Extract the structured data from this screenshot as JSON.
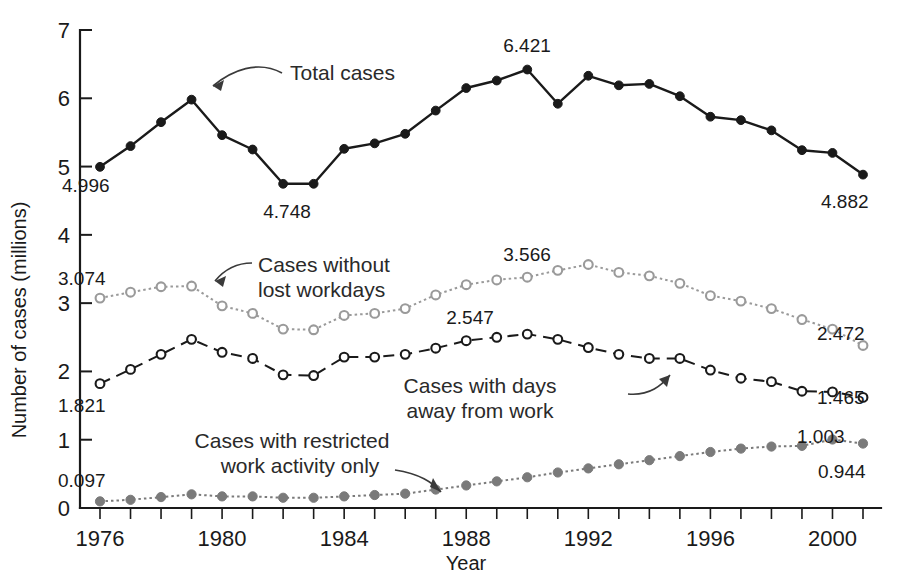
{
  "chart_data": {
    "type": "line",
    "title": "",
    "xlabel": "Year",
    "ylabel": "Number of cases (millions)",
    "xlim": [
      1976,
      2001
    ],
    "ylim": [
      0,
      7
    ],
    "grid": false,
    "legend_position": "inline-annotations",
    "x": [
      1976,
      1977,
      1978,
      1979,
      1980,
      1981,
      1982,
      1983,
      1984,
      1985,
      1986,
      1987,
      1988,
      1989,
      1990,
      1991,
      1992,
      1993,
      1994,
      1995,
      1996,
      1997,
      1998,
      1999,
      2000,
      2001
    ],
    "xtick_labels": [
      "1976",
      "1980",
      "1984",
      "1988",
      "1992",
      "1996",
      "2000"
    ],
    "xtick_values": [
      1976,
      1980,
      1984,
      1988,
      1992,
      1996,
      2000
    ],
    "ytick_labels": [
      "0",
      "1",
      "2",
      "3",
      "4",
      "5",
      "6",
      "7"
    ],
    "ytick_values": [
      0,
      1,
      2,
      3,
      4,
      5,
      6,
      7
    ],
    "series": [
      {
        "name": "Total cases",
        "marker": "filled-circle",
        "linestyle": "solid",
        "color": "#1a1a1a",
        "values": [
          4.996,
          5.3,
          5.65,
          5.98,
          5.46,
          5.25,
          4.748,
          4.748,
          5.26,
          5.34,
          5.48,
          5.82,
          6.15,
          6.26,
          6.421,
          5.92,
          6.33,
          6.19,
          6.21,
          6.03,
          5.73,
          5.68,
          5.53,
          5.24,
          5.2,
          4.882
        ],
        "endpoint_labels": [
          {
            "x": 1976,
            "value": 4.996,
            "text": "4.996"
          },
          {
            "x": 1982,
            "value": 4.748,
            "text": "4.748"
          },
          {
            "x": 1990,
            "value": 6.421,
            "text": "6.421"
          },
          {
            "x": 2001,
            "value": 4.882,
            "text": "4.882"
          }
        ]
      },
      {
        "name": "Cases without lost workdays",
        "marker": "open-circle",
        "linestyle": "dotted",
        "color": "#9a9a9a",
        "values": [
          3.074,
          3.16,
          3.24,
          3.25,
          2.96,
          2.85,
          2.62,
          2.61,
          2.82,
          2.85,
          2.92,
          3.12,
          3.27,
          3.34,
          3.38,
          3.48,
          3.566,
          3.45,
          3.4,
          3.29,
          3.11,
          3.03,
          2.92,
          2.76,
          2.62,
          2.38
        ],
        "endpoint_labels": [
          {
            "x": 1976,
            "value": 3.074,
            "text": "3.074"
          },
          {
            "x": 1992,
            "value": 3.566,
            "text": "3.566"
          },
          {
            "x": 2000,
            "value": 2.472,
            "text": "2.472"
          }
        ]
      },
      {
        "name": "Cases with days away from work",
        "marker": "open-circle",
        "linestyle": "dashed",
        "color": "#1a1a1a",
        "values": [
          1.821,
          2.03,
          2.25,
          2.47,
          2.28,
          2.19,
          1.95,
          1.94,
          2.21,
          2.21,
          2.25,
          2.34,
          2.45,
          2.5,
          2.547,
          2.47,
          2.35,
          2.25,
          2.19,
          2.19,
          2.02,
          1.9,
          1.85,
          1.71,
          1.7,
          1.62
        ],
        "endpoint_labels": [
          {
            "x": 1976,
            "value": 1.821,
            "text": "1.821"
          },
          {
            "x": 1990,
            "value": 2.547,
            "text": "2.547"
          },
          {
            "x": 2000,
            "value": 1.465,
            "text": "1.465"
          }
        ]
      },
      {
        "name": "Cases with restricted work activity only",
        "marker": "filled-circle-gray",
        "linestyle": "dotted",
        "color": "#7a7a7a",
        "values": [
          0.097,
          0.12,
          0.16,
          0.2,
          0.17,
          0.17,
          0.15,
          0.15,
          0.17,
          0.19,
          0.21,
          0.27,
          0.33,
          0.39,
          0.45,
          0.52,
          0.58,
          0.64,
          0.7,
          0.76,
          0.82,
          0.87,
          0.9,
          0.91,
          1.003,
          0.944
        ],
        "endpoint_labels": [
          {
            "x": 1976,
            "value": 0.097,
            "text": "0.097"
          },
          {
            "x": 2000,
            "value": 1.003,
            "text": "1.003"
          },
          {
            "x": 2001,
            "value": 0.944,
            "text": "0.944"
          }
        ]
      }
    ],
    "annotations": [
      {
        "name": "total-cases",
        "text": "Total cases",
        "lines": [
          "Total cases"
        ]
      },
      {
        "name": "cases-without-lost-workdays",
        "text": "Cases without lost workdays",
        "lines": [
          "Cases without",
          "lost workdays"
        ]
      },
      {
        "name": "cases-with-days-away-from-work",
        "text": "Cases with days away from work",
        "lines": [
          "Cases with days",
          "away from work"
        ]
      },
      {
        "name": "cases-with-restricted-work-activity-only",
        "text": "Cases with restricted work activity only",
        "lines": [
          "Cases with restricted",
          "work activity only"
        ]
      }
    ]
  },
  "labels": {
    "y_axis_title": "Number of cases (millions)",
    "x_axis_title": "Year",
    "ytick_0": "0",
    "ytick_1": "1",
    "ytick_2": "2",
    "ytick_3": "3",
    "ytick_4": "4",
    "ytick_5": "5",
    "ytick_6": "6",
    "ytick_7": "7",
    "xtick_1976": "1976",
    "xtick_1980": "1980",
    "xtick_1984": "1984",
    "xtick_1988": "1988",
    "xtick_1992": "1992",
    "xtick_1996": "1996",
    "xtick_2000": "2000",
    "val_4996": "4.996",
    "val_4748": "4.748",
    "val_6421": "6.421",
    "val_4882": "4.882",
    "val_3074": "3.074",
    "val_3566": "3.566",
    "val_2472": "2.472",
    "val_1821": "1.821",
    "val_2547": "2.547",
    "val_1465": "1.465",
    "val_0097": "0.097",
    "val_1003": "1.003",
    "val_0944": "0.944",
    "ann_total": "Total cases",
    "ann_without_1": "Cases without",
    "ann_without_2": "lost workdays",
    "ann_daysaway_1": "Cases with days",
    "ann_daysaway_2": "away from work",
    "ann_restricted_1": "Cases with restricted",
    "ann_restricted_2": "work activity only"
  },
  "colors": {
    "total": "#1a1a1a",
    "without_lost_workdays": "#9a9a9a",
    "days_away": "#1a1a1a",
    "restricted": "#7a7a7a",
    "axis": "#1a1a1a",
    "background": "#ffffff"
  }
}
